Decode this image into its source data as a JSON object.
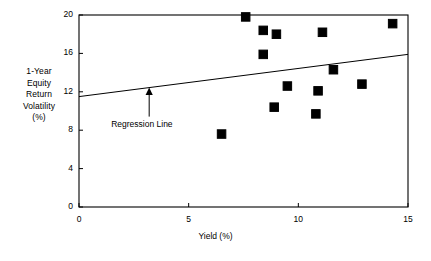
{
  "chart_data": {
    "type": "scatter",
    "title": "",
    "xlabel": "Yield (%)",
    "ylabel": "1-Year Equity Return Volatility (%)",
    "ylabel_lines": [
      "1-Year",
      "Equity",
      "Return",
      "Volatility",
      "(%)"
    ],
    "xlim": [
      0,
      15
    ],
    "ylim": [
      0,
      20
    ],
    "xticks": [
      0,
      5,
      10,
      15
    ],
    "yticks": [
      0,
      4,
      8,
      12,
      16,
      20
    ],
    "xtick_labels": [
      "0",
      "5",
      "10",
      "15"
    ],
    "ytick_labels": [
      "0",
      "4",
      "8",
      "12",
      "16",
      "20"
    ],
    "grid": false,
    "legend": "none",
    "marker": "filled-square",
    "marker_color": "#000000",
    "points": [
      {
        "x": 6.5,
        "y": 7.6
      },
      {
        "x": 7.6,
        "y": 19.8
      },
      {
        "x": 8.4,
        "y": 18.4
      },
      {
        "x": 8.4,
        "y": 15.9
      },
      {
        "x": 8.9,
        "y": 10.4
      },
      {
        "x": 9.0,
        "y": 18.0
      },
      {
        "x": 9.5,
        "y": 12.6
      },
      {
        "x": 10.8,
        "y": 9.7
      },
      {
        "x": 10.9,
        "y": 12.1
      },
      {
        "x": 11.1,
        "y": 18.2
      },
      {
        "x": 11.6,
        "y": 14.3
      },
      {
        "x": 12.9,
        "y": 12.8
      },
      {
        "x": 14.3,
        "y": 19.1
      }
    ],
    "series": [
      {
        "name": "Regression Line",
        "type": "line",
        "x": [
          0,
          15
        ],
        "values": [
          11.5,
          15.9
        ]
      }
    ],
    "annotations": [
      {
        "name": "regression-line-label",
        "text": "Regression Line",
        "x": 3.2,
        "y": 9.0,
        "arrow_to_x": 3.2,
        "arrow_to_y": 12.4
      }
    ]
  },
  "axes": {
    "x_axis_name": "Yield (%)",
    "y_axis_name": "1-Year Equity Return Volatility (%)"
  }
}
